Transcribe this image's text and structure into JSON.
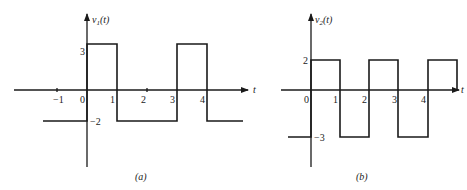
{
  "panels": {
    "a": {
      "caption": "(a)",
      "y_label": "v",
      "y_label_sub": "1",
      "y_label_arg": "(t)",
      "x_label": "t",
      "x_ticks": [
        "−1",
        "0",
        "1",
        "2",
        "3",
        "4"
      ],
      "y_ticks": [
        "3",
        "−2"
      ],
      "waveform": {
        "description": "Periodic rectangular pulse: 3 for 0<t<1, -2 for 1<t<3, 3 for 3<t<4, -2 after 4; -2 before 0",
        "levels": {
          "high": 3,
          "low": -2
        },
        "breakpoints": [
          0,
          1,
          3,
          4
        ]
      }
    },
    "b": {
      "caption": "(b)",
      "y_label": "v",
      "y_label_sub": "2",
      "y_label_arg": "(t)",
      "x_label": "t",
      "x_ticks": [
        "0",
        "1",
        "2",
        "3",
        "4"
      ],
      "y_ticks": [
        "2",
        "−3"
      ],
      "waveform": {
        "description": "Square wave: 2 for 0<t<1, -3 for 1<t<2, 2 for 2<t<3, -3 for 3<t<4, 2 for 4<t<5; -3 before 0",
        "levels": {
          "high": 2,
          "low": -3
        },
        "breakpoints": [
          0,
          1,
          2,
          3,
          4,
          5
        ]
      }
    }
  }
}
